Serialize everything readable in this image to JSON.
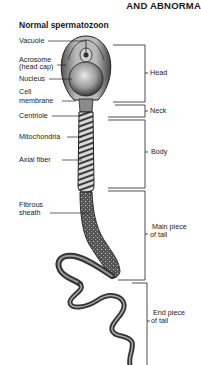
{
  "header": {
    "text": "AND ABNORMA"
  },
  "diagram": {
    "title": "Normal spermatozoon",
    "left_labels": [
      {
        "id": "vacuole",
        "text": "Vacuole"
      },
      {
        "id": "acrosome",
        "line1": "Acrosome",
        "line2": "(head cap)"
      },
      {
        "id": "nucleus",
        "text": "Nucleus"
      },
      {
        "id": "cell-membrane",
        "line1": "Cell",
        "line2": "membrane"
      },
      {
        "id": "centriole",
        "text": "Centriole"
      },
      {
        "id": "mitochondria",
        "text": "Mitochondria"
      },
      {
        "id": "axial-fiber",
        "text": "Axial fiber"
      },
      {
        "id": "fibrous-sheath",
        "line1": "Fibrous",
        "line2": "sheath"
      }
    ],
    "right_labels": [
      {
        "id": "head",
        "text": "Head"
      },
      {
        "id": "neck",
        "text": "Neck"
      },
      {
        "id": "body",
        "text": "Body"
      },
      {
        "id": "main-piece",
        "line1": "Main piece",
        "line2": "of tail"
      },
      {
        "id": "end-piece",
        "line1": "End piece",
        "line2": "of tail"
      }
    ]
  }
}
